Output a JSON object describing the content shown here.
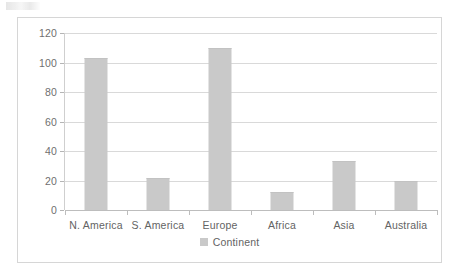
{
  "chart_data": {
    "type": "bar",
    "title": "",
    "xlabel": "",
    "ylabel": "",
    "categories": [
      "N. America",
      "S. America",
      "Europe",
      "Africa",
      "Asia",
      "Australia"
    ],
    "values": [
      103,
      22,
      110,
      12,
      33,
      20
    ],
    "series": [
      {
        "name": "Continent",
        "values": [
          103,
          22,
          110,
          12,
          33,
          20
        ]
      }
    ],
    "ylim": [
      0,
      120
    ],
    "ytick_labels": [
      "0",
      "20",
      "40",
      "60",
      "80",
      "100",
      "120"
    ],
    "ytick_values": [
      0,
      20,
      40,
      60,
      80,
      100,
      120
    ],
    "grid": true,
    "grid_orientation": "horizontal",
    "legend": {
      "position": "bottom-center",
      "entries": [
        {
          "label": "Continent",
          "color": "#c9c9c9"
        }
      ]
    },
    "colors": {
      "bar_fill": "#c9c9c9",
      "gridline": "#d9d9d9",
      "axis_line": "#bdbdbd",
      "tick_label": "#6f6f6f",
      "category_label": "#636363",
      "chart_border": "#d6d6d6",
      "background": "#ffffff"
    }
  }
}
